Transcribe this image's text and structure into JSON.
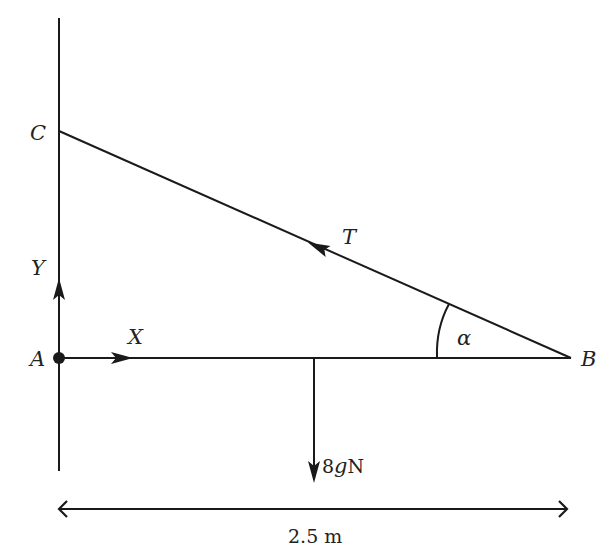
{
  "diagram": {
    "type": "statics-force-diagram",
    "points": {
      "A": {
        "label": "A"
      },
      "B": {
        "label": "B"
      },
      "C": {
        "label": "C"
      }
    },
    "forces": {
      "reaction_x": {
        "label": "X"
      },
      "reaction_y": {
        "label": "Y"
      },
      "tension": {
        "label": "T"
      },
      "weight": {
        "label": "8gN",
        "value_prefix": "8",
        "g": "g",
        "unit": "N"
      }
    },
    "angle": {
      "label": "α"
    },
    "dimension": {
      "label": "2.5 m",
      "value": "2.5",
      "unit": "m"
    },
    "colors": {
      "line": "#1a1a1a",
      "text": "#222222",
      "background": "#ffffff"
    }
  }
}
